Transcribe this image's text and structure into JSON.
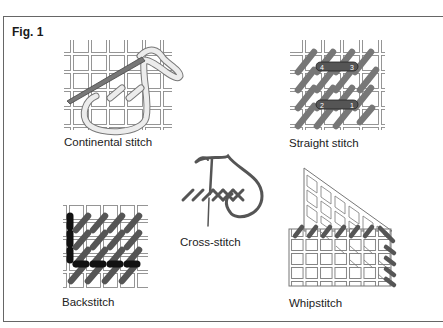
{
  "figure": {
    "label": "Fig. 1",
    "panels": [
      {
        "id": "continental",
        "caption": "Continental stitch"
      },
      {
        "id": "straight",
        "caption": "Straight stitch",
        "step_numbers": [
          "4",
          "3",
          "2",
          "1"
        ]
      },
      {
        "id": "cross",
        "caption": "Cross-stitch"
      },
      {
        "id": "backstitch",
        "caption": "Backstitch"
      },
      {
        "id": "whipstitch",
        "caption": "Whipstitch"
      }
    ]
  },
  "colors": {
    "grid": "#8a8a8a",
    "stitch_gray": "#7a7a7a",
    "stitch_dark": "#4a4a4a",
    "stitch_black": "#151515",
    "yarn_light": "#e6e6e6",
    "border": "#666666"
  }
}
